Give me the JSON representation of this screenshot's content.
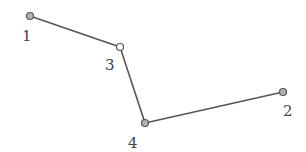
{
  "diagram": {
    "type": "polyline-graph",
    "line_color": "#555555",
    "nodes": [
      {
        "id": "1",
        "label": "1",
        "x": 30,
        "y": 16,
        "fill": "#b0b0b0",
        "label_x": 27,
        "label_y": 41
      },
      {
        "id": "3",
        "label": "3",
        "x": 120,
        "y": 47,
        "fill": "#ffffff",
        "label_x": 110,
        "label_y": 70
      },
      {
        "id": "4",
        "label": "4",
        "x": 145,
        "y": 123,
        "fill": "#b0b0b0",
        "label_x": 133,
        "label_y": 148
      },
      {
        "id": "2",
        "label": "2",
        "x": 283,
        "y": 92,
        "fill": "#b0b0b0",
        "label_x": 288,
        "label_y": 116
      }
    ],
    "edges": [
      [
        "1",
        "3"
      ],
      [
        "3",
        "4"
      ],
      [
        "4",
        "2"
      ]
    ]
  }
}
